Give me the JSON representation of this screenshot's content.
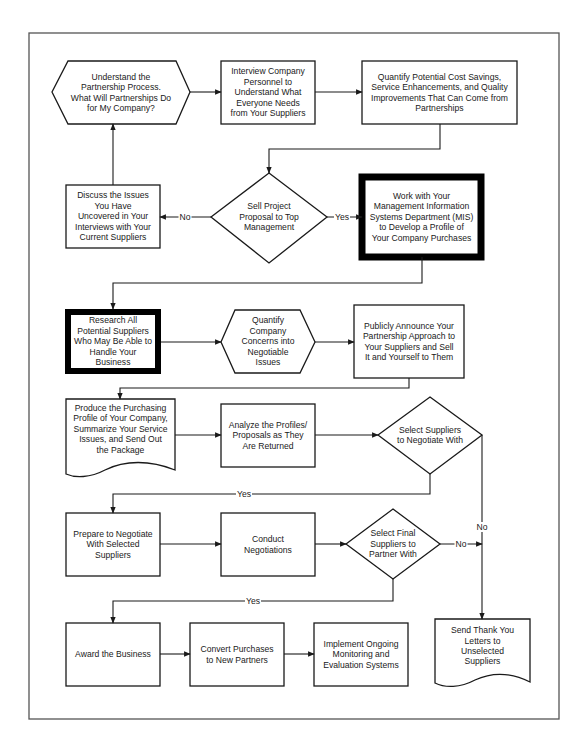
{
  "diagram": {
    "type": "flowchart",
    "colors": {
      "line": "#1a1a1a",
      "frame": "#555555",
      "background": "#ffffff",
      "emphasis_border": "#000000"
    },
    "nodes": [
      {
        "id": "understand",
        "shape": "hexagon",
        "text": "Understand the\nPartnership Process.\nWhat Will Partnerships Do\nfor My Company?"
      },
      {
        "id": "interview",
        "shape": "rect",
        "text": "Interview Company\nPersonnel  to\nUnderstand What\nEveryone Needs\nfrom Your Suppliers"
      },
      {
        "id": "quantify_savings",
        "shape": "rect",
        "text": "Quantify Potential Cost Savings,\nService Enhancements, and Quality\nImprovements That Can Come from\nPartnerships"
      },
      {
        "id": "discuss",
        "shape": "rect",
        "text": "Discuss the Issues\nYou Have\nUncovered in Your\nInterviews with Your\nCurrent Suppliers"
      },
      {
        "id": "sell",
        "shape": "diamond",
        "text": "Sell Project\nProposal to Top\nManagement"
      },
      {
        "id": "mis",
        "shape": "rect-thick",
        "text": "Work with Your\nManagement Information\nSystems Department (MIS)\nto Develop a Profile of\nYour Company Purchases"
      },
      {
        "id": "research",
        "shape": "rect-thick",
        "text": "Research All\nPotential Suppliers\nWho May Be Able to\nHandle Your\nBusiness"
      },
      {
        "id": "quantify_concerns",
        "shape": "hexagon",
        "text": "Quantify\nCompany\nConcerns into\nNegotiable\nIssues"
      },
      {
        "id": "announce",
        "shape": "rect",
        "text": "Publicly Announce Your\nPartnership Approach to\nYour Suppliers and Sell\nIt and Yourself to Them"
      },
      {
        "id": "produce",
        "shape": "document",
        "text": "Produce the Purchasing\nProfile of Your Company,\nSummarize Your Service\nIssues, and Send Out\nthe Package"
      },
      {
        "id": "analyze",
        "shape": "rect",
        "text": "Analyze the Profiles/\nProposals as They\nAre Returned"
      },
      {
        "id": "select_negotiate",
        "shape": "diamond",
        "text": "Select Suppliers\nto Negotiate With"
      },
      {
        "id": "prepare",
        "shape": "rect",
        "text": "Prepare to Negotiate\nWith Selected\nSuppliers"
      },
      {
        "id": "conduct",
        "shape": "rect",
        "text": "Conduct\nNegotiations"
      },
      {
        "id": "select_final",
        "shape": "diamond",
        "text": "Select Final\nSuppliers to\nPartner With"
      },
      {
        "id": "award",
        "shape": "rect",
        "text": "Award the Business"
      },
      {
        "id": "convert",
        "shape": "rect",
        "text": "Convert Purchases\nto New Partners"
      },
      {
        "id": "implement",
        "shape": "rect",
        "text": "Implement Ongoing\nMonitoring and\nEvaluation Systems"
      },
      {
        "id": "thankyou",
        "shape": "document",
        "text": "Send Thank You\nLetters to\nUnselected\nSuppliers"
      }
    ],
    "edge_labels": {
      "sell_no": "No",
      "sell_yes": "Yes",
      "select_negotiate_yes": "Yes",
      "select_negotiate_no": "No",
      "select_final_no": "No",
      "select_final_yes": "Yes"
    }
  }
}
